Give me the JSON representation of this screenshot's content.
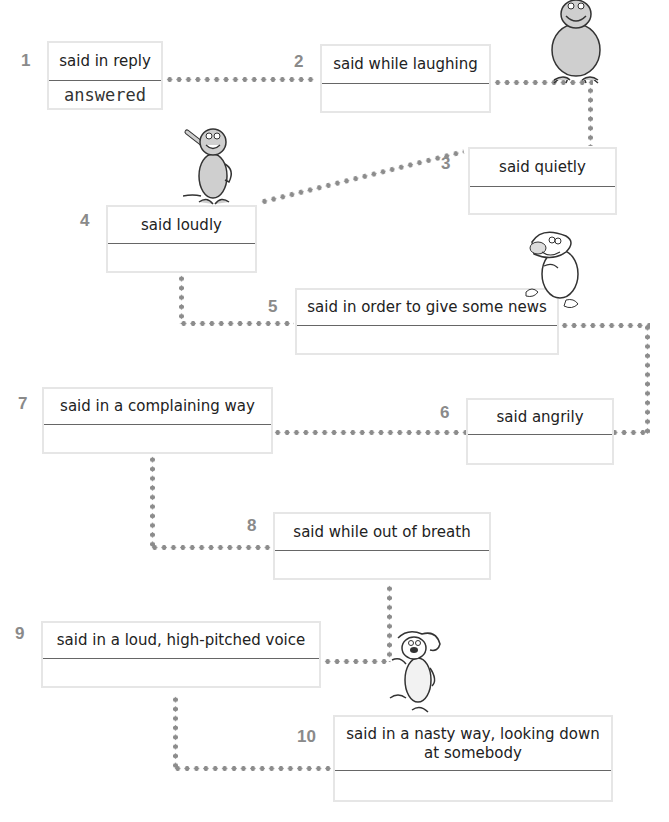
{
  "exercise": {
    "items": [
      {
        "number": "1",
        "prompt": "said in reply",
        "answer": "answered"
      },
      {
        "number": "2",
        "prompt": "said while laughing",
        "answer": ""
      },
      {
        "number": "3",
        "prompt": "said quietly",
        "answer": ""
      },
      {
        "number": "4",
        "prompt": "said loudly",
        "answer": ""
      },
      {
        "number": "5",
        "prompt": "said in order to give some news",
        "answer": ""
      },
      {
        "number": "6",
        "prompt": "said angrily",
        "answer": ""
      },
      {
        "number": "7",
        "prompt": "said in a complaining way",
        "answer": ""
      },
      {
        "number": "8",
        "prompt": "said while out of breath",
        "answer": ""
      },
      {
        "number": "9",
        "prompt": "said in a loud, high-pitched voice",
        "answer": ""
      },
      {
        "number": "10",
        "prompt": "said in a nasty way, looking down at somebody",
        "answer": ""
      }
    ]
  },
  "illustrations": [
    "gorilla-cartoon",
    "monkey-cartoon",
    "sheep-cartoon",
    "dog-cartoon"
  ],
  "colors": {
    "dots": "#8c8c8c",
    "numbers": "#8a8a8a",
    "box_border": "#e6e6e6"
  }
}
